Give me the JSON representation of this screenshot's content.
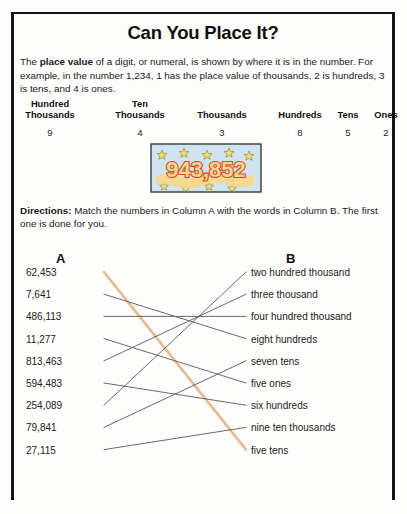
{
  "worksheet": {
    "title": "Can You Place It?",
    "intro_parts": {
      "before": "The ",
      "bold": "place value",
      "after": " of a digit, or numeral, is shown by where it is in the number. For example, in the number 1,234, 1 has the place value of thousands, 2 is hundreds, 3 is tens, and 4 is ones."
    },
    "directions": {
      "label": "Directions:",
      "text": " Match the numbers in Column A with the words in Column B. The first one is done for you."
    },
    "place_value_table": {
      "headers": [
        "Hundred\nThousands",
        "Ten\nThousands",
        "Thousands",
        "Hundreds",
        "Tens",
        "Ones"
      ],
      "digits": [
        "9",
        "4",
        "3",
        "8",
        "5",
        "2"
      ]
    },
    "artwork": {
      "name": "number-943852-graphic",
      "number": "943,852",
      "background_color": "#cfe3f0",
      "numeral_fill": "#f5d98a",
      "numeral_outline": "#d9482a",
      "star_color": "#efe06a"
    },
    "columns": {
      "a_label": "A",
      "b_label": "B",
      "column_a": [
        "62,453",
        "7,641",
        "486,113",
        "11,277",
        "813,463",
        "594,483",
        "254,089",
        "79,841",
        "27,115"
      ],
      "column_b": [
        "two hundred thousand",
        "three thousand",
        "four hundred thousand",
        "eight hundreds",
        "seven tens",
        "five ones",
        "six hundreds",
        "nine ten thousands",
        "five tens"
      ]
    },
    "matches": [
      {
        "from": 0,
        "to": 8,
        "example": true,
        "color": "#e8b98a"
      },
      {
        "from": 1,
        "to": 3,
        "example": false,
        "color": "#555a5e"
      },
      {
        "from": 2,
        "to": 2,
        "example": false,
        "color": "#555a5e"
      },
      {
        "from": 3,
        "to": 5,
        "example": false,
        "color": "#555a5e"
      },
      {
        "from": 4,
        "to": 1,
        "example": false,
        "color": "#555a5e"
      },
      {
        "from": 5,
        "to": 6,
        "example": false,
        "color": "#555a5e"
      },
      {
        "from": 6,
        "to": 0,
        "example": false,
        "color": "#555a5e"
      },
      {
        "from": 7,
        "to": 4,
        "example": false,
        "color": "#555a5e"
      },
      {
        "from": 8,
        "to": 7,
        "example": false,
        "color": "#555a5e"
      }
    ],
    "layout": {
      "col_a_top": 267,
      "col_b_top": 267,
      "row_step": 22.2,
      "line_start_x": 104,
      "line_end_x": 246
    }
  }
}
